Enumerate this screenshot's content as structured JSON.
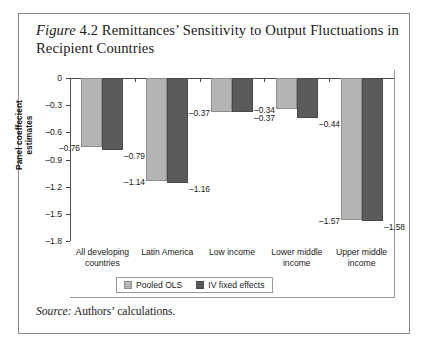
{
  "figure": {
    "label_italic": "Figure",
    "number_and_title": " 4.2 Remittances’ Sensitivity to Output Fluctuations in Recipient Countries",
    "source_label_italic": "Source:",
    "source_text": " Authors’ calculations."
  },
  "colors": {
    "pooled_ols": "#b4b4b4",
    "iv_fixed_effects": "#5b5b5b",
    "axis": "#4a4a4a",
    "frame": "#8a8a8a",
    "text": "#1a1a1a"
  },
  "chart_data": {
    "type": "bar",
    "title": "Figure 4.2 Remittances’ Sensitivity to Output Fluctuations in Recipient Countries",
    "xlabel": "",
    "ylabel": "Panel coeffecient estimates",
    "ylim": [
      -1.8,
      0
    ],
    "yticks": [
      0,
      -0.3,
      -0.6,
      -0.9,
      -1.2,
      -1.5,
      -1.8
    ],
    "ytick_labels": [
      "0",
      "–0.3",
      "–0.6",
      "–0.9",
      "–1.2",
      "–1.5",
      "–1.8"
    ],
    "grid": false,
    "legend_position": "bottom",
    "categories": [
      "All developing countries",
      "Latin America",
      "Low income",
      "Lower middle income",
      "Upper middle income"
    ],
    "category_lines": [
      [
        "All developing",
        "countries"
      ],
      [
        "Latin America",
        ""
      ],
      [
        "Low income",
        ""
      ],
      [
        "Lower middle",
        "income"
      ],
      [
        "Upper middle",
        "income"
      ]
    ],
    "series": [
      {
        "name": "Pooled OLS",
        "color": "#b4b4b4",
        "values": [
          -0.76,
          -1.14,
          -0.37,
          -0.34,
          -1.57
        ],
        "value_labels": [
          "–0.76",
          "–1.14",
          "–0.37",
          "–0.34",
          "–1.57"
        ]
      },
      {
        "name": "IV fixed effects",
        "color": "#5b5b5b",
        "values": [
          -0.79,
          -1.16,
          -0.37,
          -0.44,
          -1.58
        ],
        "value_labels": [
          "–0.79",
          "–1.16",
          "–0.37",
          "–0.44",
          "–1.58"
        ]
      }
    ]
  }
}
